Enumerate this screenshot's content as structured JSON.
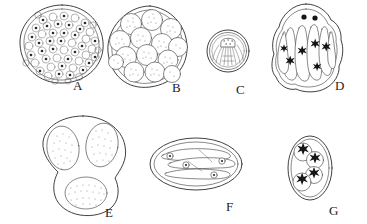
{
  "figure": {
    "type": "scientific-line-drawing",
    "background_color": "#ffffff",
    "ink_color": "#2b2b2b",
    "width_px": 367,
    "height_px": 224,
    "panel_count": 7
  },
  "panels": [
    {
      "id": "A",
      "label": "A",
      "label_x": 78,
      "label_y": 86,
      "shape": "round cyst, single thin wall",
      "center_x": 62,
      "center_y": 44,
      "radius_x": 41,
      "radius_y": 39,
      "contents": "densely packed small round bodies, each with a dark central dot",
      "body_count": 56,
      "body_radius": 4.0,
      "wall_layers": 2,
      "shading": "outline dots"
    },
    {
      "id": "B",
      "label": "B",
      "label_x": 177,
      "label_y": 88,
      "shape": "irregular rounded cyst",
      "center_x": 147,
      "center_y": 47,
      "radius_x": 40,
      "radius_y": 41,
      "contents": "large stippled spherical sporocysts",
      "body_count": 14,
      "body_radius": 10.5,
      "wall_layers": 2,
      "shading": "stipple"
    },
    {
      "id": "C",
      "label": "C",
      "label_x": 241,
      "label_y": 90,
      "shape": "small circular cyst, concentric rings",
      "center_x": 228,
      "center_y": 51,
      "radius_x": 21,
      "radius_y": 21,
      "contents": "dome-shaped inner body with radiating striations",
      "body_count": 1,
      "wall_layers": 3,
      "shading": "radiating lines"
    },
    {
      "id": "D",
      "label": "D",
      "label_x": 340,
      "label_y": 86,
      "shape": "ovoid oocyst with crinkled wall",
      "center_x": 308,
      "center_y": 48,
      "radius_x": 36,
      "radius_y": 44,
      "contents": "elongate banana-shaped sporozoites with dark stellate nuclei; two dark polar granules at the apex",
      "body_count": 6,
      "polar_granules": 2,
      "wall_layers": 2,
      "shading": "outline"
    },
    {
      "id": "E",
      "label": "E",
      "label_x": 110,
      "label_y": 213,
      "shape": "pear / trilobed cyst",
      "center_x": 83,
      "center_y": 165,
      "radius_x": 45,
      "radius_y": 50,
      "contents": "three oval stippled sporocysts, two upper and one lower",
      "body_count": 3,
      "wall_layers": 1,
      "shading": "stipple"
    },
    {
      "id": "F",
      "label": "F",
      "label_x": 231,
      "label_y": 207,
      "shape": "elongate horizontal oval oocyst, double wall",
      "center_x": 196,
      "center_y": 164,
      "radius_x": 46,
      "radius_y": 27,
      "contents": "four elongate sporozoites lying lengthwise, each with a small ring nucleus",
      "body_count": 4,
      "wall_layers": 2,
      "shading": "outline"
    },
    {
      "id": "G",
      "label": "G",
      "label_x": 334,
      "label_y": 211,
      "shape": "vertical oval oocyst",
      "center_x": 310,
      "center_y": 168,
      "radius_x": 22,
      "radius_y": 32,
      "contents": "four overlapping spherical sporocysts in a diagonal chain, each with a dark stellate residuum",
      "body_count": 4,
      "wall_layers": 2,
      "shading": "dark stellate nuclei"
    }
  ],
  "labels": {
    "a": "A",
    "b": "B",
    "c": "C",
    "d": "D",
    "e": "E",
    "f": "F",
    "g": "G"
  }
}
